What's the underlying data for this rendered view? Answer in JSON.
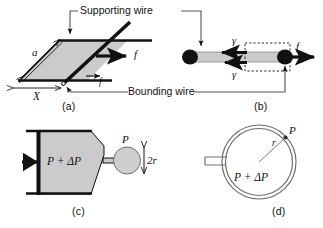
{
  "figure": {
    "background_color": "#ffffff",
    "ink_color": "#111111",
    "film_fill_color": "#cccccc",
    "panels": [
      {
        "tag": "(a)",
        "description": "Soap film on a rectangular frame stretched by a sliding bounding wire",
        "labels": [
          "a",
          "X",
          "f",
          "f"
        ]
      },
      {
        "tag": "(b)",
        "description": "Edge-on view of the film showing two surface tension forces gamma opposing applied force f",
        "labels": [
          "γ",
          "γ",
          "f"
        ]
      },
      {
        "tag": "(c)",
        "description": "Syringe with piston pressurising a spherical bubble of radius r",
        "labels": [
          "P + ΔP",
          "P",
          "2r"
        ]
      },
      {
        "tag": "(d)",
        "description": "Cross-section of the spherical bubble wall with inner excess pressure",
        "labels": [
          "P",
          "r",
          "P + ΔP"
        ]
      }
    ]
  },
  "annotations": {
    "supporting_wire": "Supporting wire",
    "bounding_wire": "Bounding wire"
  },
  "panel_tags": {
    "a": "(a)",
    "b": "(b)",
    "c": "(c)",
    "d": "(d)"
  },
  "panel_a": {
    "side_label": "a",
    "width_label": "X",
    "force_label_right": "f",
    "force_label_lower": "f"
  },
  "panel_b": {
    "gamma_top": "γ",
    "gamma_bottom": "γ",
    "force_label": "f"
  },
  "panel_c": {
    "inner_pressure": "P + ΔP",
    "outer_pressure": "P",
    "diameter_label": "2r"
  },
  "panel_d": {
    "outer_pressure": "P",
    "radius_label": "r",
    "inner_pressure": "P + ΔP"
  }
}
